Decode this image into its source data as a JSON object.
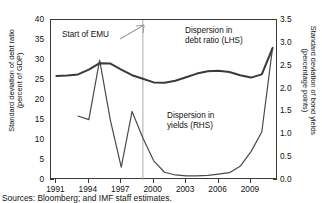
{
  "chart_data": {
    "type": "line",
    "title": "",
    "xlabel": "",
    "ylabel": "Standard deviation of debt ratio\n(percent of GDP)",
    "ylabel_right": "Standard deviation of bond yields\n(percentage points)",
    "xlim": [
      1990.5,
      2011.5
    ],
    "ylim": [
      0,
      40
    ],
    "ylim_right": [
      0.0,
      3.5
    ],
    "grid": false,
    "legend": "inline annotations",
    "xticks": [
      "1991",
      "1994",
      "1997",
      "2000",
      "2003",
      "2006",
      "2009"
    ],
    "xtick_values": [
      1991,
      1994,
      1997,
      2000,
      2003,
      2006,
      2009
    ],
    "yticks_left": [
      "0",
      "5",
      "10",
      "15",
      "20",
      "25",
      "30",
      "35",
      "40"
    ],
    "ytick_values_left": [
      0,
      5,
      10,
      15,
      20,
      25,
      30,
      35,
      40
    ],
    "yticks_right": [
      "0.0",
      "0.5",
      "1.0",
      "1.5",
      "2.0",
      "2.5",
      "3.0",
      "3.5"
    ],
    "ytick_values_right": [
      0.0,
      0.5,
      1.0,
      1.5,
      2.0,
      2.5,
      3.0,
      3.5
    ],
    "series": [
      {
        "name": "Dispersion in debt ratio (LHS)",
        "axis": "left",
        "color": "#3a3a3a",
        "width": 2.0,
        "x": [
          1991,
          1992,
          1993,
          1994,
          1995,
          1996,
          1997,
          1998,
          1999,
          2000,
          2001,
          2002,
          2003,
          2004,
          2005,
          2006,
          2007,
          2008,
          2009,
          2010,
          2011
        ],
        "values": [
          26.0,
          26.1,
          26.4,
          27.6,
          29.2,
          29.1,
          27.6,
          26.2,
          25.3,
          24.4,
          24.3,
          24.8,
          25.7,
          26.6,
          27.2,
          27.3,
          27.0,
          26.2,
          25.6,
          26.4,
          33.0
        ]
      },
      {
        "name": "Dispersion in yields (RHS)",
        "axis": "right",
        "color": "#4a4a4a",
        "width": 1.2,
        "x": [
          1993,
          1994,
          1995,
          1996,
          1997,
          1998,
          1999,
          2000,
          2001,
          2002,
          2003,
          2004,
          2005,
          2006,
          2007,
          2008,
          2009,
          2010,
          2011
        ],
        "values": [
          1.4,
          1.32,
          2.62,
          1.3,
          0.28,
          1.5,
          0.92,
          0.42,
          0.17,
          0.11,
          0.09,
          0.09,
          0.1,
          0.13,
          0.16,
          0.3,
          0.62,
          1.05,
          2.9
        ]
      }
    ],
    "annotations": [
      {
        "name": "start-of-emu",
        "text": "Start of EMU",
        "x": 1993.4,
        "y": 35.2,
        "arrow_to_x": 1999,
        "arrow_to_y": 37.5
      },
      {
        "name": "debt-ratio-label",
        "text": "Dispersion in\ndebt ratio (LHS)",
        "x": 2003.2,
        "y": 36.0
      },
      {
        "name": "yields-label",
        "text": "Dispersion in\nyields (RHS)",
        "x": 2001.6,
        "y": 16.5
      }
    ],
    "marker_lines": [
      {
        "name": "emu-start-line",
        "x": 1999,
        "color": "#aaaaaa",
        "style": "solid"
      }
    ]
  },
  "source_note": "Sources: Bloomberg; and IMF staff estimates."
}
